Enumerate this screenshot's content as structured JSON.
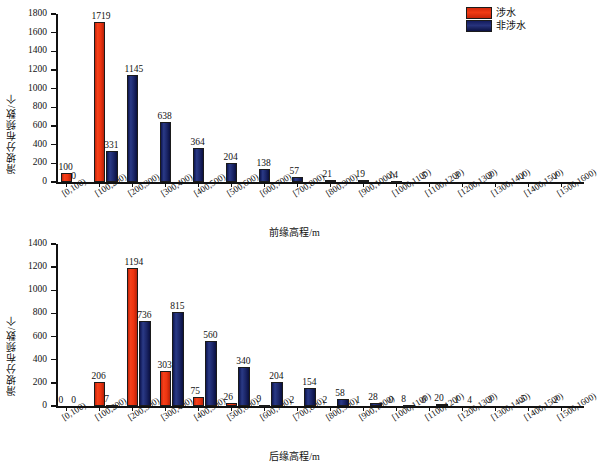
{
  "legend": {
    "position": "top-right",
    "entries": [
      {
        "label": "涉水",
        "color": "#ee3410",
        "key": "wading"
      },
      {
        "label": "非涉水",
        "color": "#1b2668",
        "key": "non-wading"
      }
    ]
  },
  "colors": {
    "series_wading": "#ee3410",
    "series_non_wading": "#1b2668",
    "axis": "#111111",
    "background": "#ffffff"
  },
  "chart_data": [
    {
      "id": "front-edge-elevation",
      "type": "bar",
      "title": "",
      "xlabel": "前缘高程/m",
      "ylabel": "滑坡分布频数/个",
      "ylim": [
        0,
        1800
      ],
      "yticks": [
        0,
        200,
        400,
        600,
        800,
        1000,
        1200,
        1400,
        1600,
        1800
      ],
      "grid": false,
      "legend_position": "top-right",
      "categories": [
        "[0,100)",
        "[100,200)",
        "[200,300)",
        "[300,400)",
        "[400,500)",
        "[500,600)",
        "[600,700)",
        "[700,800)",
        "[800,900)",
        "[900,1000)",
        "[1000,1100)",
        "[1100,1200)",
        "[1200,1300)",
        "[1300,1400)",
        "[1400,1500)",
        "[1500,1600)"
      ],
      "series": [
        {
          "name": "涉水",
          "color": "#ee3410",
          "values": [
            100,
            1719,
            null,
            null,
            null,
            null,
            null,
            null,
            null,
            null,
            null,
            null,
            null,
            null,
            null,
            null
          ]
        },
        {
          "name": "非涉水",
          "color": "#1b2668",
          "values": [
            0,
            331,
            1145,
            638,
            364,
            204,
            138,
            57,
            21,
            19,
            14,
            5,
            3,
            3,
            1,
            1
          ]
        }
      ]
    },
    {
      "id": "rear-edge-elevation",
      "type": "bar",
      "title": "",
      "xlabel": "后缘高程/m",
      "ylabel": "滑坡分布频数/个",
      "ylim": [
        0,
        1400
      ],
      "yticks": [
        0,
        200,
        400,
        600,
        800,
        1000,
        1200,
        1400
      ],
      "grid": false,
      "legend_position": "top-right",
      "categories": [
        "[0,100)",
        "[100,200)",
        "[200,300)",
        "[300,400)",
        "[400,500)",
        "[500,600)",
        "[600,700)",
        "[700,800)",
        "[800,900)",
        "[900,1000)",
        "[1000,1100)",
        "[1100,1200)",
        "[1200,1300)",
        "[1300,1400)",
        "[1400,1500)",
        "[1500,1600)"
      ],
      "series": [
        {
          "name": "涉水",
          "color": "#ee3410",
          "values": [
            0,
            206,
            1194,
            303,
            75,
            26,
            9,
            2,
            2,
            1,
            0,
            0,
            1,
            null,
            null,
            null
          ]
        },
        {
          "name": "非涉水",
          "color": "#1b2668",
          "values": [
            0,
            7,
            736,
            815,
            560,
            340,
            204,
            154,
            58,
            28,
            8,
            20,
            4,
            3,
            5,
            2
          ]
        }
      ]
    }
  ]
}
